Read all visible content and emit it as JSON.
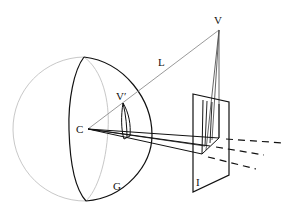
{
  "figure": {
    "type": "perspective-projection-diagram",
    "labels": {
      "viewpoint_center": "C",
      "line_of_sight": "L",
      "scene_point": "V",
      "projected_point": "V′",
      "sphere": "G",
      "image_plane": "I"
    },
    "colors": {
      "ink": "#111111",
      "gray": "#9a9a9a",
      "light_gray": "#c8c8c8"
    }
  }
}
